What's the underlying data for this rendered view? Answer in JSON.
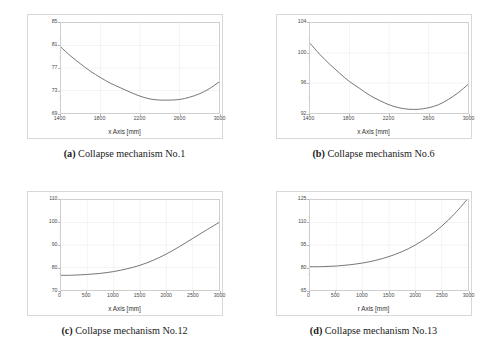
{
  "figure": {
    "panels": [
      {
        "key": "a",
        "tag": "(a)",
        "caption_text": "Collapse mechanism No.1",
        "ylabel": "Collapse load [kN/m²]",
        "xlabel": "x Axis [mm]",
        "chart_data": {
          "type": "line",
          "title": "Collapse mechanism No.1",
          "xlabel": "x Axis [mm]",
          "ylabel": "Collapse load [kN/m²]",
          "xlim": [
            1400,
            3000
          ],
          "ylim": [
            69,
            85
          ],
          "xticks": [
            1400,
            1800,
            2200,
            2600,
            3000
          ],
          "yticks": [
            69,
            73,
            77,
            81,
            85
          ],
          "grid": true,
          "x": [
            1400,
            1500,
            1600,
            1700,
            1800,
            1900,
            2000,
            2100,
            2200,
            2300,
            2400,
            2500,
            2600,
            2700,
            2800,
            2900,
            3000
          ],
          "values": [
            80.7,
            79.1,
            77.7,
            76.4,
            75.3,
            74.3,
            73.5,
            72.7,
            72.0,
            71.5,
            71.3,
            71.3,
            71.4,
            71.8,
            72.4,
            73.3,
            74.5
          ]
        }
      },
      {
        "key": "b",
        "tag": "(b)",
        "caption_text": "Collapse mechanism No.6",
        "ylabel": "Collapse load [kN/m²]",
        "xlabel": "x Axis [mm]",
        "chart_data": {
          "type": "line",
          "title": "Collapse mechanism No.6",
          "xlabel": "x Axis [mm]",
          "ylabel": "Collapse load [kN/m²]",
          "xlim": [
            1400,
            3000
          ],
          "ylim": [
            92,
            104
          ],
          "xticks": [
            1400,
            1800,
            2200,
            2600,
            3000
          ],
          "yticks": [
            92,
            96,
            100,
            104
          ],
          "grid": true,
          "x": [
            1400,
            1500,
            1600,
            1700,
            1800,
            1900,
            2000,
            2100,
            2200,
            2300,
            2400,
            2500,
            2600,
            2700,
            2800,
            2900,
            3000
          ],
          "values": [
            101.3,
            99.8,
            98.5,
            97.3,
            96.2,
            95.3,
            94.4,
            93.7,
            93.1,
            92.7,
            92.5,
            92.5,
            92.7,
            93.1,
            93.8,
            94.7,
            95.8
          ]
        }
      },
      {
        "key": "c",
        "tag": "(c)",
        "caption_text": "Collapse mechanism No.12",
        "ylabel": "Collapse load [kN/m²]",
        "xlabel": "x Axis [mm]",
        "chart_data": {
          "type": "line",
          "title": "Collapse mechanism No.12",
          "xlabel": "x Axis [mm]",
          "ylabel": "Collapse load [kN/m²]",
          "xlim": [
            0,
            3000
          ],
          "ylim": [
            70,
            110
          ],
          "xticks": [
            0,
            500,
            1000,
            1500,
            2000,
            2500,
            3000
          ],
          "yticks": [
            70,
            80,
            90,
            100,
            110
          ],
          "grid": true,
          "x": [
            0,
            250,
            500,
            750,
            1000,
            1250,
            1500,
            1750,
            2000,
            2250,
            2500,
            2750,
            3000
          ],
          "values": [
            76.5,
            76.6,
            76.9,
            77.4,
            78.2,
            79.4,
            81.0,
            83.2,
            86.0,
            89.3,
            92.9,
            96.5,
            100.0
          ]
        }
      },
      {
        "key": "d",
        "tag": "(d)",
        "caption_text": "Collapse mechanism No.13",
        "ylabel": "Collapse load [kN/m²]",
        "xlabel": "r Axis [mm]",
        "chart_data": {
          "type": "line",
          "title": "Collapse mechanism No.13",
          "xlabel": "r Axis [mm]",
          "ylabel": "Collapse load [kN/m²]",
          "xlim": [
            0,
            3000
          ],
          "ylim": [
            65,
            125
          ],
          "xticks": [
            0,
            500,
            1000,
            1500,
            2000,
            2500,
            3000
          ],
          "yticks": [
            65,
            80,
            95,
            110,
            125
          ],
          "grid": true,
          "x": [
            0,
            250,
            500,
            750,
            1000,
            1250,
            1500,
            1750,
            2000,
            2250,
            2500,
            2750,
            3000
          ],
          "values": [
            80.5,
            80.6,
            81.0,
            81.8,
            83.0,
            84.8,
            87.3,
            90.6,
            95.0,
            100.6,
            107.5,
            116.0,
            126.0
          ]
        }
      }
    ],
    "colors": {
      "curve": "#5a5a5a",
      "grid": "#ececec",
      "axis": "#cfcfcf",
      "frame": "#d8d8d8",
      "text": "#333333"
    }
  }
}
